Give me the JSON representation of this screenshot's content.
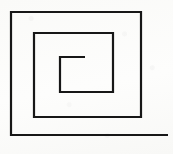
{
  "figure": {
    "kind": "line-drawing",
    "width": 173,
    "height": 154,
    "background_color": "#fdfdfc",
    "stroke_color": "#171717",
    "stroke_width": 2.2,
    "turns": 2.25,
    "winding": "counterclockwise-outward",
    "caption": ""
  },
  "spiral": {
    "description": "Single continuous polyline forming a square spiral with two and a quarter turns, open at both ends.",
    "start_point": {
      "x": 85,
      "y": 57,
      "label": "inner free end"
    },
    "end_point": {
      "x": 168,
      "y": 135,
      "label": "outer free end"
    },
    "points": [
      [
        85,
        57
      ],
      [
        60,
        57
      ],
      [
        60,
        92
      ],
      [
        113,
        92
      ],
      [
        113,
        33
      ],
      [
        34,
        33
      ],
      [
        34,
        117
      ],
      [
        141,
        117
      ],
      [
        141,
        12
      ],
      [
        11,
        12
      ],
      [
        11,
        135
      ],
      [
        168,
        135
      ]
    ],
    "segments": [
      {
        "name": "inner-top",
        "orientation": "horizontal",
        "from": [
          85,
          57
        ],
        "to": [
          60,
          57
        ],
        "length": 25
      },
      {
        "name": "inner-left",
        "orientation": "vertical",
        "from": [
          60,
          57
        ],
        "to": [
          60,
          92
        ],
        "length": 35
      },
      {
        "name": "inner-bottom",
        "orientation": "horizontal",
        "from": [
          60,
          92
        ],
        "to": [
          113,
          92
        ],
        "length": 53
      },
      {
        "name": "inner-right",
        "orientation": "vertical",
        "from": [
          113,
          92
        ],
        "to": [
          113,
          33
        ],
        "length": 59
      },
      {
        "name": "middle-top",
        "orientation": "horizontal",
        "from": [
          113,
          33
        ],
        "to": [
          34,
          33
        ],
        "length": 79
      },
      {
        "name": "middle-left",
        "orientation": "vertical",
        "from": [
          34,
          33
        ],
        "to": [
          34,
          117
        ],
        "length": 84
      },
      {
        "name": "middle-bottom",
        "orientation": "horizontal",
        "from": [
          34,
          117
        ],
        "to": [
          141,
          117
        ],
        "length": 107
      },
      {
        "name": "outer-right",
        "orientation": "vertical",
        "from": [
          141,
          117
        ],
        "to": [
          141,
          12
        ],
        "length": 105
      },
      {
        "name": "outer-top",
        "orientation": "horizontal",
        "from": [
          141,
          12
        ],
        "to": [
          11,
          12
        ],
        "length": 130
      },
      {
        "name": "outer-left",
        "orientation": "vertical",
        "from": [
          11,
          12
        ],
        "to": [
          11,
          135
        ],
        "length": 123
      },
      {
        "name": "outer-bottom-tail",
        "orientation": "horizontal",
        "from": [
          11,
          135
        ],
        "to": [
          168,
          135
        ],
        "length": 157
      }
    ]
  }
}
